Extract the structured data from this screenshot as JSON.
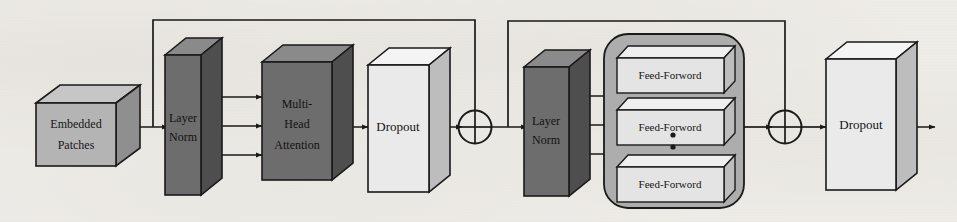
{
  "diagram": {
    "type": "block-diagram",
    "background_color": "#f3f1ed",
    "palette": {
      "dark_block": "#6d6d6d",
      "dark_block_top": "#8a8a8a",
      "dark_block_side": "#4e4e4e",
      "mid_block": "#b4b4b4",
      "mid_block_top": "#cfcfcf",
      "mid_block_side": "#949494",
      "light_block": "#e9e9e9",
      "light_block_top": "#f4f4f4",
      "light_block_side": "#bdbdbd",
      "container": "#adadad",
      "stroke": "#1a1a1a"
    },
    "nodes": [
      {
        "id": "embedded-patches",
        "label_lines": [
          "Embedded",
          "Patches"
        ],
        "shape": "box3d",
        "fill": "mid"
      },
      {
        "id": "layer-norm-1",
        "label_lines": [
          "Layer",
          "Norm"
        ],
        "shape": "box3d",
        "fill": "dark"
      },
      {
        "id": "multi-head-attention",
        "label_lines": [
          "Multi-",
          "Head",
          "Attention"
        ],
        "shape": "box3d",
        "fill": "dark"
      },
      {
        "id": "dropout-1",
        "label_lines": [
          "Dropout"
        ],
        "shape": "box3d",
        "fill": "light"
      },
      {
        "id": "add-1",
        "label_lines": [],
        "shape": "plus-circle",
        "fill": "none"
      },
      {
        "id": "layer-norm-2",
        "label_lines": [
          "Layer",
          "Norm"
        ],
        "shape": "box3d",
        "fill": "dark"
      },
      {
        "id": "feed-forward-group",
        "label_lines": [],
        "shape": "rounded-container",
        "fill": "container"
      },
      {
        "id": "feed-forward-1",
        "label_lines": [
          "Feed-Forword"
        ],
        "shape": "box3d",
        "fill": "light"
      },
      {
        "id": "feed-forward-2",
        "label_lines": [
          "Feed-Forword"
        ],
        "shape": "box3d",
        "fill": "light"
      },
      {
        "id": "feed-forward-n",
        "label_lines": [
          "Feed-Forword"
        ],
        "shape": "box3d",
        "fill": "light"
      },
      {
        "id": "vertical-ellipsis",
        "label_lines": [],
        "shape": "dots",
        "fill": "stroke"
      },
      {
        "id": "add-2",
        "label_lines": [],
        "shape": "plus-circle",
        "fill": "none"
      },
      {
        "id": "dropout-2",
        "label_lines": [
          "Dropout"
        ],
        "shape": "box3d",
        "fill": "light"
      }
    ],
    "labels": {
      "embedded_patches_line1": "Embedded",
      "embedded_patches_line2": "Patches",
      "layer_norm_line1": "Layer",
      "layer_norm_line2": "Norm",
      "mha_line1": "Multi-",
      "mha_line2": "Head",
      "mha_line3": "Attention",
      "dropout": "Dropout",
      "feed_forward": "Feed-Forword"
    },
    "edges": [
      {
        "from": "embedded-patches",
        "to": "layer-norm-1",
        "kind": "arrow"
      },
      {
        "from": "embedded-patches",
        "to": "add-1",
        "kind": "skip-connection"
      },
      {
        "from": "layer-norm-1",
        "to": "multi-head-attention",
        "kind": "arrow",
        "count": 3
      },
      {
        "from": "multi-head-attention",
        "to": "dropout-1",
        "kind": "arrow"
      },
      {
        "from": "dropout-1",
        "to": "add-1",
        "kind": "arrow"
      },
      {
        "from": "add-1",
        "to": "layer-norm-2",
        "kind": "arrow"
      },
      {
        "from": "add-1",
        "to": "add-2",
        "kind": "skip-connection"
      },
      {
        "from": "layer-norm-2",
        "to": "feed-forward-group",
        "kind": "arrow",
        "count": 3
      },
      {
        "from": "feed-forward-group",
        "to": "add-2",
        "kind": "arrow"
      },
      {
        "from": "add-2",
        "to": "dropout-2",
        "kind": "arrow"
      },
      {
        "from": "dropout-2",
        "to": "output",
        "kind": "arrow"
      }
    ]
  }
}
